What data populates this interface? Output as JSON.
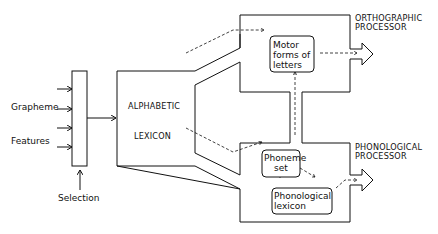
{
  "diagram": {
    "inputs": {
      "grapheme_label": "Grapheme",
      "features_label": "Features",
      "selection_label": "Selection"
    },
    "alphabetic_lexicon": {
      "line1": "ALPHABETIC",
      "line2": "LEXICON"
    },
    "orthographic_processor": {
      "title_line1": "ORTHOGRAPHIC",
      "title_line2": "PROCESSOR",
      "inner_box": {
        "line1": "Motor",
        "line2": "forms of",
        "line3": "letters"
      }
    },
    "phonological_processor": {
      "title_line1": "PHONOLOGICAL",
      "title_line2": "PROCESSOR",
      "phoneme_set": {
        "line1": "Phoneme",
        "line2": "set"
      },
      "phonological_lexicon": {
        "line1": "Phonological",
        "line2": "lexicon"
      }
    }
  }
}
